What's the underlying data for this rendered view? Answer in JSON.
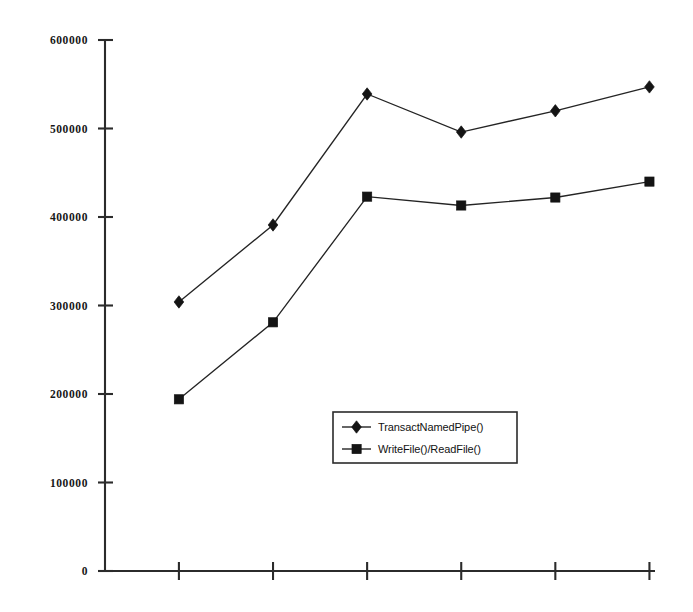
{
  "chart_data": {
    "type": "line",
    "title": "",
    "xlabel": "",
    "ylabel": "",
    "ylim": [
      0,
      600000
    ],
    "xlim": [
      0.5,
      6.5
    ],
    "grid": false,
    "legend_position": "center",
    "x": [
      1,
      2,
      3,
      4,
      5,
      6
    ],
    "categories": [
      "",
      "",
      "",
      "",
      "",
      ""
    ],
    "ytick_labels": [
      "600000",
      "500000",
      "400000",
      "300000",
      "200000",
      "100000",
      "0"
    ],
    "ytick_values": [
      600000,
      500000,
      400000,
      300000,
      200000,
      100000,
      0
    ],
    "xtick_labels": [
      "",
      "",
      "",
      "",
      "",
      ""
    ],
    "series": [
      {
        "name": "TransactNamedPipe()",
        "marker": "diamond",
        "color": "#141414",
        "values": [
          304000,
          391000,
          539000,
          496000,
          520000,
          547000
        ]
      },
      {
        "name": "WriteFile()/ReadFile()",
        "marker": "square",
        "color": "#141414",
        "values": [
          194000,
          281000,
          423000,
          413000,
          422000,
          440000
        ]
      }
    ],
    "legend": [
      {
        "label": "TransactNamedPipe()",
        "marker": "diamond"
      },
      {
        "label": "WriteFile()/ReadFile()",
        "marker": "square"
      }
    ]
  }
}
